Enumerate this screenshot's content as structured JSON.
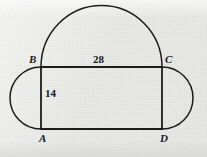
{
  "figure": {
    "background_color": "#ececea",
    "stroke_color": "#1c1c1c",
    "vertex_labels": {
      "A": "A",
      "B": "B",
      "C": "C",
      "D": "D"
    },
    "measurements": {
      "top_side": "28",
      "left_side": "14"
    },
    "geometry": {
      "rectangle": {
        "B": [
          41,
          67
        ],
        "C": [
          162,
          67
        ],
        "A": [
          41,
          129
        ],
        "D": [
          162,
          129
        ],
        "width_px": 121,
        "height_px": 62
      },
      "semicircles": [
        {
          "name": "top-semicircle-on-BC",
          "from": "B",
          "to": "C",
          "bulge": "up"
        },
        {
          "name": "left-semicircle-on-AB",
          "from": "B",
          "to": "A",
          "bulge": "left"
        },
        {
          "name": "right-semicircle-on-CD",
          "from": "C",
          "to": "D",
          "bulge": "right"
        }
      ]
    }
  }
}
